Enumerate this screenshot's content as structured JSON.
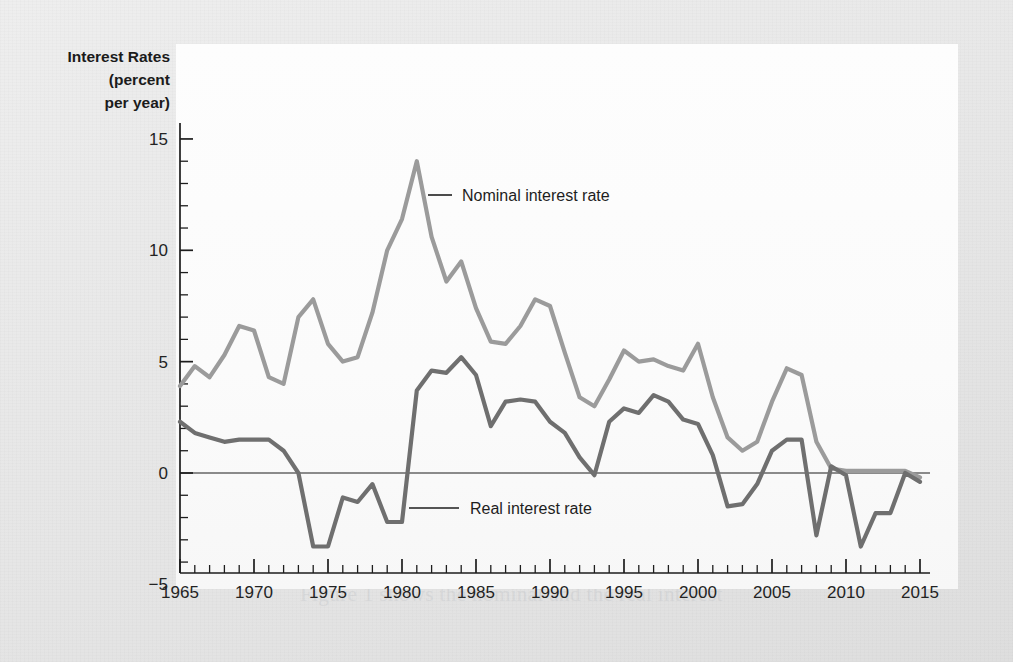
{
  "figure": {
    "y_axis_title_lines": [
      "Interest Rates",
      "(percent",
      "per year)"
    ],
    "nominal_label": "Nominal interest rate",
    "real_label": "Real interest rate",
    "colors": {
      "nominal_line": "#9b9b9b",
      "real_line": "#6f6f6f",
      "axis": "#1d1d1d",
      "panel_background": "#fbfbfb",
      "page_background": "#e8e8e8",
      "text": "#1b1b1b"
    }
  },
  "bleed_text": {
    "right_column": [
      "to keep some wealth in a form that can easily be",
      "converted into money. The cost of holding money",
      "is the interest rate that could be earned on other",
      "assets. A higher interest rate raises the cost of",
      "holding money and so reduces the quantity of real",
      "money demanded.",
      "The real interest rate is the nominal interest rate",
      "minus the inflation rate. It is the real interest rate",
      "that influences saving and investment decisions.",
      "Figure 1 shows the nominal and the real interest",
      "rate in the United States from 1965 to 2015."
    ],
    "top_lines": [
      "costs of production. The quantity of money demanded",
      "Figure 10 shows two episodes when the price level",
      "is rising and money in the economy was growing at",
      "a rate of 10 percent. But why does this mean a fall in",
      "the quantity of real money? To see the answer, think",
      "about a person's wealth, and the desire to hold money"
    ]
  },
  "chart_data": {
    "type": "line",
    "title": "",
    "xlabel": "",
    "ylabel": "Interest Rates (percent per year)",
    "xlim": [
      1965,
      2015
    ],
    "ylim": [
      -5,
      16.5
    ],
    "ytick_labels": [
      "15",
      "10",
      "5",
      "0",
      "-5"
    ],
    "ytick_values": [
      15,
      10,
      5,
      0,
      -5
    ],
    "ytick_minor_step": 1,
    "xtick_labels": [
      "1965",
      "1970",
      "1975",
      "1980",
      "1985",
      "1990",
      "1995",
      "2000",
      "2005",
      "2010",
      "2015"
    ],
    "xtick_values": [
      1965,
      1970,
      1975,
      1980,
      1985,
      1990,
      1995,
      2000,
      2005,
      2010,
      2015
    ],
    "xtick_minor_step": 1,
    "grid": false,
    "legend_position": "inline-annotation",
    "zero_line": true,
    "x": [
      1965,
      1966,
      1967,
      1968,
      1969,
      1970,
      1971,
      1972,
      1973,
      1974,
      1975,
      1976,
      1977,
      1978,
      1979,
      1980,
      1981,
      1982,
      1983,
      1984,
      1985,
      1986,
      1987,
      1988,
      1989,
      1990,
      1991,
      1992,
      1993,
      1994,
      1995,
      1996,
      1997,
      1998,
      1999,
      2000,
      2001,
      2002,
      2003,
      2004,
      2005,
      2006,
      2007,
      2008,
      2009,
      2010,
      2011,
      2012,
      2013,
      2014,
      2015
    ],
    "series": [
      {
        "name": "Nominal interest rate",
        "color": "#9b9b9b",
        "values": [
          3.9,
          4.8,
          4.3,
          5.3,
          6.6,
          6.4,
          4.3,
          4.0,
          7.0,
          7.8,
          5.8,
          5.0,
          5.2,
          7.2,
          10.0,
          11.4,
          14.0,
          10.6,
          8.6,
          9.5,
          7.4,
          5.9,
          5.8,
          6.6,
          7.8,
          7.5,
          5.4,
          3.4,
          3.0,
          4.2,
          5.5,
          5.0,
          5.1,
          4.8,
          4.6,
          5.8,
          3.4,
          1.6,
          1.0,
          1.4,
          3.2,
          4.7,
          4.4,
          1.4,
          0.2,
          0.1,
          0.1,
          0.1,
          0.1,
          0.1,
          -0.2
        ]
      },
      {
        "name": "Real interest rate",
        "color": "#6f6f6f",
        "values": [
          2.3,
          1.8,
          1.6,
          1.4,
          1.5,
          1.5,
          1.5,
          1.0,
          0.0,
          -3.3,
          -3.3,
          -1.1,
          -1.3,
          -0.5,
          -2.2,
          -2.2,
          3.7,
          4.6,
          4.5,
          5.2,
          4.4,
          2.1,
          3.2,
          3.3,
          3.2,
          2.3,
          1.8,
          0.7,
          -0.1,
          2.3,
          2.9,
          2.7,
          3.5,
          3.2,
          2.4,
          2.2,
          0.8,
          -1.5,
          -1.4,
          -0.5,
          1.0,
          1.5,
          1.5,
          -2.8,
          0.3,
          -0.1,
          -3.3,
          -1.8,
          -1.8,
          0.0,
          -0.4
        ]
      }
    ],
    "annotations": [
      {
        "text": "Nominal interest rate",
        "x": 1984,
        "y": 11.5
      },
      {
        "text": "Real interest rate",
        "x": 1981.5,
        "y": -2.6
      }
    ]
  }
}
